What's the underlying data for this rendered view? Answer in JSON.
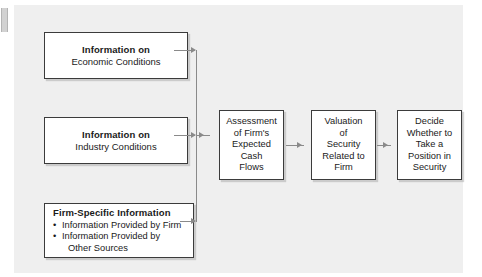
{
  "diagram": {
    "background_color": "#efefef",
    "box_border_color": "#3b3b3b",
    "connector_color": "#8a8a8a",
    "sources": [
      {
        "id": "economic",
        "title": "Information on",
        "subtitle": "Economic Conditions"
      },
      {
        "id": "industry",
        "title": "Information on",
        "subtitle": "Industry Conditions"
      },
      {
        "id": "firm",
        "title": "Firm-Specific Information",
        "bullets": [
          "Information Provided by Firm",
          "Information Provided by"
        ],
        "bullet_continuation": "Other Sources",
        "bullet_glyph": "•"
      }
    ],
    "chain": [
      {
        "id": "assessment",
        "lines": [
          "Assessment",
          "of Firm's",
          "Expected",
          "Cash",
          "Flows"
        ]
      },
      {
        "id": "valuation",
        "lines": [
          "Valuation",
          "of",
          "Security",
          "Related to",
          "Firm"
        ]
      },
      {
        "id": "decide",
        "lines": [
          "Decide",
          "Whether to",
          "Take a",
          "Position in",
          "Security"
        ]
      }
    ]
  }
}
